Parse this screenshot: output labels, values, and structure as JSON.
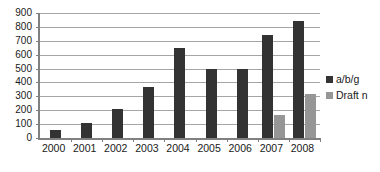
{
  "chart_data": {
    "type": "bar",
    "title": "",
    "subtitle": "",
    "xlabel": "",
    "ylabel": "",
    "categories": [
      "2000",
      "2001",
      "2002",
      "2003",
      "2004",
      "2005",
      "2006",
      "2007",
      "2008"
    ],
    "series": [
      {
        "name": "a/b/g",
        "color": "#333333",
        "values": [
          55,
          110,
          210,
          370,
          650,
          500,
          500,
          745,
          845
        ]
      },
      {
        "name": "Draft n",
        "color": "#969696",
        "values": [
          0,
          0,
          0,
          0,
          0,
          0,
          0,
          165,
          320
        ]
      }
    ],
    "ylim": [
      0,
      900
    ],
    "ytick_step": 100,
    "ytick_labels": [
      "0",
      "100",
      "200",
      "300",
      "400",
      "500",
      "600",
      "700",
      "800",
      "900"
    ],
    "grid": true,
    "grid_axis": "y",
    "legend_position": "right",
    "legend_entries": [
      {
        "label": "a/b/g",
        "swatch": "dark-square-swatch"
      },
      {
        "label": "Draft n",
        "swatch": "gray-square-swatch"
      }
    ]
  }
}
